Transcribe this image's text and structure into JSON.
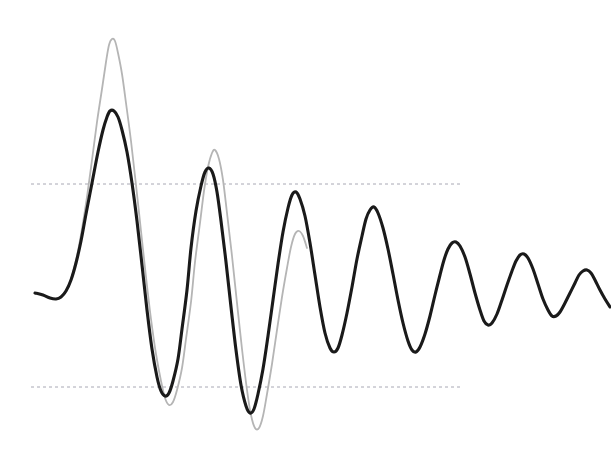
{
  "figure": {
    "width": 611,
    "height": 460,
    "background_color": "#ffffff"
  },
  "chart_data": {
    "type": "line",
    "title": "",
    "subtitle": "",
    "xlabel": "",
    "ylabel": "",
    "xlim": [
      0,
      611
    ],
    "ylim": [
      460,
      0
    ],
    "grid": false,
    "axes_visible": false,
    "tick_labels_visible": false,
    "legend": {
      "visible": false,
      "position": "none",
      "entries": [
        {
          "name": "Measured response",
          "color": "#1a1a1a"
        },
        {
          "name": "Reference envelope",
          "color": "#b0b0b0"
        }
      ]
    },
    "annotations": [
      {
        "name": "upper-threshold",
        "type": "hline",
        "y": 184,
        "x_start": 31,
        "x_end": 461,
        "style": "dashed",
        "color": "#a8a8b4",
        "label": ""
      },
      {
        "name": "lower-threshold",
        "type": "hline",
        "y": 387,
        "x_start": 31,
        "x_end": 461,
        "style": "dashed",
        "color": "#a8a8b4",
        "label": ""
      }
    ],
    "series": [
      {
        "name": "Measured response",
        "color": "#1a1a1a",
        "line_width": 3.1,
        "points": [
          [
            35,
            293
          ],
          [
            43,
            295
          ],
          [
            50,
            298
          ],
          [
            56,
            299
          ],
          [
            61,
            297
          ],
          [
            66,
            291
          ],
          [
            71,
            280
          ],
          [
            76,
            263
          ],
          [
            81,
            241
          ],
          [
            86,
            214
          ],
          [
            92,
            183
          ],
          [
            98,
            152
          ],
          [
            103,
            130
          ],
          [
            107,
            117
          ],
          [
            110,
            111
          ],
          [
            114,
            111
          ],
          [
            118,
            117
          ],
          [
            122,
            130
          ],
          [
            127,
            152
          ],
          [
            132,
            183
          ],
          [
            137,
            221
          ],
          [
            142,
            265
          ],
          [
            147,
            310
          ],
          [
            152,
            349
          ],
          [
            157,
            377
          ],
          [
            161,
            391
          ],
          [
            165,
            396
          ],
          [
            169,
            393
          ],
          [
            173,
            381
          ],
          [
            178,
            359
          ],
          [
            182,
            329
          ],
          [
            187,
            290
          ],
          [
            191,
            248
          ],
          [
            196,
            211
          ],
          [
            201,
            186
          ],
          [
            205,
            172
          ],
          [
            209,
            168
          ],
          [
            213,
            174
          ],
          [
            217,
            192
          ],
          [
            221,
            221
          ],
          [
            226,
            262
          ],
          [
            231,
            307
          ],
          [
            236,
            350
          ],
          [
            241,
            385
          ],
          [
            246,
            406
          ],
          [
            250,
            413
          ],
          [
            254,
            409
          ],
          [
            258,
            394
          ],
          [
            263,
            369
          ],
          [
            268,
            336
          ],
          [
            273,
            300
          ],
          [
            278,
            264
          ],
          [
            283,
            232
          ],
          [
            288,
            208
          ],
          [
            292,
            195
          ],
          [
            296,
            192
          ],
          [
            300,
            199
          ],
          [
            305,
            216
          ],
          [
            310,
            243
          ],
          [
            315,
            275
          ],
          [
            320,
            307
          ],
          [
            325,
            333
          ],
          [
            330,
            348
          ],
          [
            334,
            352
          ],
          [
            338,
            348
          ],
          [
            342,
            335
          ],
          [
            347,
            313
          ],
          [
            352,
            287
          ],
          [
            357,
            259
          ],
          [
            362,
            236
          ],
          [
            366,
            219
          ],
          [
            370,
            210
          ],
          [
            374,
            207
          ],
          [
            378,
            213
          ],
          [
            383,
            228
          ],
          [
            388,
            249
          ],
          [
            393,
            274
          ],
          [
            398,
            300
          ],
          [
            403,
            323
          ],
          [
            408,
            341
          ],
          [
            412,
            350
          ],
          [
            416,
            352
          ],
          [
            420,
            347
          ],
          [
            425,
            334
          ],
          [
            430,
            316
          ],
          [
            435,
            295
          ],
          [
            440,
            275
          ],
          [
            444,
            260
          ],
          [
            448,
            249
          ],
          [
            452,
            243
          ],
          [
            456,
            242
          ],
          [
            460,
            246
          ],
          [
            465,
            257
          ],
          [
            470,
            274
          ],
          [
            475,
            293
          ],
          [
            480,
            310
          ],
          [
            484,
            321
          ],
          [
            488,
            325
          ],
          [
            492,
            323
          ],
          [
            497,
            314
          ],
          [
            502,
            300
          ],
          [
            507,
            285
          ],
          [
            512,
            271
          ],
          [
            516,
            261
          ],
          [
            520,
            255
          ],
          [
            524,
            254
          ],
          [
            528,
            258
          ],
          [
            533,
            269
          ],
          [
            538,
            284
          ],
          [
            543,
            299
          ],
          [
            548,
            310
          ],
          [
            552,
            316
          ],
          [
            556,
            316
          ],
          [
            560,
            312
          ],
          [
            565,
            303
          ],
          [
            570,
            293
          ],
          [
            575,
            283
          ],
          [
            579,
            275
          ],
          [
            583,
            271
          ],
          [
            587,
            270
          ],
          [
            591,
            273
          ],
          [
            595,
            280
          ],
          [
            600,
            290
          ],
          [
            605,
            299
          ],
          [
            610,
            307
          ]
        ]
      },
      {
        "name": "Reference envelope",
        "color": "#b5b5b5",
        "line_width": 1.8,
        "points": [
          [
            62,
            296
          ],
          [
            67,
            289
          ],
          [
            72,
            276
          ],
          [
            77,
            256
          ],
          [
            82,
            229
          ],
          [
            87,
            197
          ],
          [
            92,
            160
          ],
          [
            97,
            122
          ],
          [
            102,
            89
          ],
          [
            106,
            62
          ],
          [
            109,
            45
          ],
          [
            112,
            39
          ],
          [
            115,
            41
          ],
          [
            118,
            53
          ],
          [
            122,
            74
          ],
          [
            126,
            103
          ],
          [
            131,
            141
          ],
          [
            136,
            185
          ],
          [
            141,
            231
          ],
          [
            146,
            277
          ],
          [
            151,
            319
          ],
          [
            156,
            354
          ],
          [
            161,
            381
          ],
          [
            165,
            398
          ],
          [
            169,
            405
          ],
          [
            173,
            402
          ],
          [
            177,
            390
          ],
          [
            182,
            368
          ],
          [
            186,
            339
          ],
          [
            191,
            302
          ],
          [
            195,
            262
          ],
          [
            200,
            223
          ],
          [
            204,
            191
          ],
          [
            208,
            167
          ],
          [
            212,
            153
          ],
          [
            215,
            150
          ],
          [
            219,
            159
          ],
          [
            223,
            180
          ],
          [
            227,
            213
          ],
          [
            232,
            256
          ],
          [
            237,
            303
          ],
          [
            242,
            349
          ],
          [
            247,
            390
          ],
          [
            251,
            415
          ],
          [
            255,
            428
          ],
          [
            259,
            428
          ],
          [
            263,
            416
          ],
          [
            267,
            394
          ],
          [
            272,
            364
          ],
          [
            277,
            330
          ],
          [
            282,
            297
          ],
          [
            287,
            268
          ],
          [
            291,
            247
          ],
          [
            295,
            234
          ],
          [
            299,
            231
          ],
          [
            303,
            236
          ],
          [
            307,
            248
          ]
        ]
      }
    ]
  }
}
